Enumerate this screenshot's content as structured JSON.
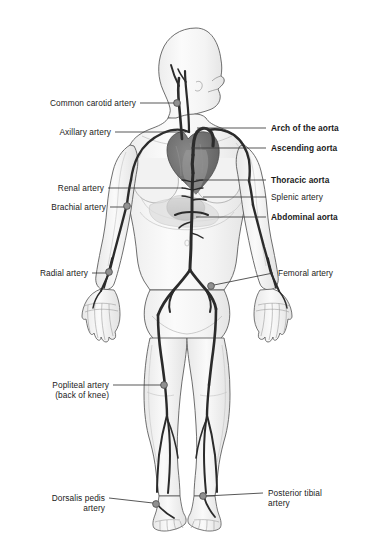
{
  "figure": {
    "background_color": "#ffffff",
    "artery_color": "#2b2b2b",
    "body_outline_color": "#4a4a4a",
    "body_fill_color": "#f7f7f7",
    "heart_color": "#6d6d6d",
    "marker_color": "#909090",
    "marker_outline_color": "#4a4a4a",
    "leader_color": "#3a3a3a",
    "text_color": "#1a1a1a"
  },
  "labels": {
    "left": [
      {
        "id": "common-carotid-artery",
        "text": "Common carotid artery",
        "bold": false,
        "lines": [
          "Common carotid artery"
        ],
        "text_x": 18,
        "text_y": 99,
        "leader_from_x": 140,
        "leader_from_y": 103,
        "leader_to_x": 175,
        "leader_to_y": 103,
        "marker_x": 177,
        "marker_y": 103
      },
      {
        "id": "axillary-artery",
        "text": "Axillary artery",
        "bold": false,
        "lines": [
          "Axillary artery"
        ],
        "text_x": 38,
        "text_y": 128,
        "leader_from_x": 115,
        "leader_from_y": 132,
        "leader_to_x": 186,
        "leader_to_y": 132,
        "marker_x": null,
        "marker_y": null
      },
      {
        "id": "renal-artery",
        "text": "Renal artery",
        "bold": false,
        "lines": [
          "Renal artery"
        ],
        "text_x": 42,
        "text_y": 184,
        "leader_from_x": 108,
        "leader_from_y": 188,
        "leader_to_x": 183,
        "leader_to_y": 188,
        "marker_x": null,
        "marker_y": null
      },
      {
        "id": "brachial-artery",
        "text": "Brachial artery",
        "bold": false,
        "lines": [
          "Brachial artery"
        ],
        "text_x": 36,
        "text_y": 203,
        "leader_from_x": 110,
        "leader_from_y": 207,
        "leader_to_x": 124,
        "leader_to_y": 207,
        "marker_x": 127,
        "marker_y": 206
      },
      {
        "id": "radial-artery",
        "text": "Radial artery",
        "bold": false,
        "lines": [
          "Radial artery"
        ],
        "text_x": 28,
        "text_y": 269,
        "leader_from_x": 92,
        "leader_from_y": 273,
        "leader_to_x": 106,
        "leader_to_y": 273,
        "marker_x": 109,
        "marker_y": 272
      },
      {
        "id": "popliteal-artery",
        "text": "Popliteal artery (back of knee)",
        "bold": false,
        "lines": [
          "Popliteal artery",
          "(back of knee)"
        ],
        "text_x": 38,
        "text_y": 381,
        "leader_from_x": 113,
        "leader_from_y": 385,
        "leader_to_x": 161,
        "leader_to_y": 385,
        "marker_x": 164,
        "marker_y": 385
      },
      {
        "id": "dorsalis-pedis-artery",
        "text": "Dorsalis pedis artery",
        "bold": false,
        "lines": [
          "Dorsalis pedis",
          "artery"
        ],
        "text_x": 44,
        "text_y": 494,
        "leader_from_x": 109,
        "leader_from_y": 498,
        "leader_to_x": 153,
        "leader_to_y": 503,
        "marker_x": 156,
        "marker_y": 504
      }
    ],
    "right": [
      {
        "id": "arch-of-the-aorta",
        "text": "Arch of the aorta",
        "bold": true,
        "lines": [
          "Arch of the aorta"
        ],
        "text_x": 271,
        "text_y": 124,
        "leader_from_x": 266,
        "leader_from_y": 128,
        "leader_to_x": 197,
        "leader_to_y": 128,
        "marker_x": null,
        "marker_y": null
      },
      {
        "id": "ascending-aorta",
        "text": "Ascending aorta",
        "bold": true,
        "lines": [
          "Ascending aorta"
        ],
        "text_x": 271,
        "text_y": 144,
        "leader_from_x": 266,
        "leader_from_y": 148,
        "leader_to_x": 191,
        "leader_to_y": 148,
        "marker_x": null,
        "marker_y": null
      },
      {
        "id": "thoracic-aorta",
        "text": "Thoracic aorta",
        "bold": true,
        "lines": [
          "Thoracic aorta"
        ],
        "text_x": 271,
        "text_y": 176,
        "leader_from_x": 266,
        "leader_from_y": 180,
        "leader_to_x": 196,
        "leader_to_y": 180,
        "marker_x": null,
        "marker_y": null
      },
      {
        "id": "splenic-artery",
        "text": "Splenic artery",
        "bold": false,
        "lines": [
          "Splenic artery"
        ],
        "text_x": 271,
        "text_y": 193,
        "leader_from_x": 266,
        "leader_from_y": 197,
        "leader_to_x": 203,
        "leader_to_y": 197,
        "marker_x": null,
        "marker_y": null
      },
      {
        "id": "abdominal-aorta",
        "text": "Abdominal aorta",
        "bold": true,
        "lines": [
          "Abdominal aorta"
        ],
        "text_x": 271,
        "text_y": 213,
        "leader_from_x": 266,
        "leader_from_y": 217,
        "leader_to_x": 196,
        "leader_to_y": 217,
        "marker_x": null,
        "marker_y": null
      },
      {
        "id": "femoral-artery",
        "text": "Femoral artery",
        "bold": false,
        "lines": [
          "Femoral artery"
        ],
        "text_x": 278,
        "text_y": 269,
        "leader_from_x": 273,
        "leader_from_y": 273,
        "leader_to_x": 214,
        "leader_to_y": 285,
        "marker_x": 211,
        "marker_y": 286
      },
      {
        "id": "posterior-tibial-artery",
        "text": "Posterior tibial artery",
        "bold": false,
        "lines": [
          "Posterior tibial",
          "artery"
        ],
        "text_x": 268,
        "text_y": 489,
        "leader_from_x": 263,
        "leader_from_y": 493,
        "leader_to_x": 206,
        "leader_to_y": 496,
        "marker_x": 203,
        "marker_y": 496
      }
    ]
  }
}
